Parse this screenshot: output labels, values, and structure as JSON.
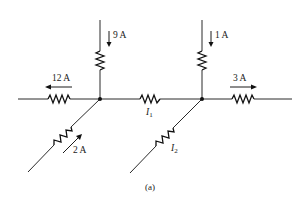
{
  "figure": {
    "caption": "(a)",
    "nodes": [
      {
        "id": "left-node",
        "x": 100,
        "y": 99
      },
      {
        "id": "right-node",
        "x": 202,
        "y": 99
      }
    ],
    "branches": [
      {
        "id": "top-left",
        "label": "9 A",
        "direction": "down",
        "into": "left-node"
      },
      {
        "id": "left",
        "label": "12 A",
        "direction": "left",
        "from": "left-node"
      },
      {
        "id": "bottom-left",
        "label": "2 A",
        "direction": "up-right",
        "into": "left-node"
      },
      {
        "id": "middle",
        "label": "I",
        "subscript": "1",
        "between": [
          "left-node",
          "right-node"
        ]
      },
      {
        "id": "top-right",
        "label": "1 A",
        "direction": "down",
        "into": "right-node"
      },
      {
        "id": "right",
        "label": "3 A",
        "direction": "right",
        "from": "right-node"
      },
      {
        "id": "bottom-right",
        "label": "I",
        "subscript": "2",
        "into": "right-node"
      }
    ]
  },
  "labels": {
    "i9": "9 A",
    "i12": "12 A",
    "i2": "2 A",
    "i1": "1 A",
    "i3": "3 A",
    "I1_main": "I",
    "I1_sub": "1",
    "I2_main": "I",
    "I2_sub": "2"
  },
  "colors": {
    "wire": "#2a2a2a",
    "background": "#ffffff"
  }
}
